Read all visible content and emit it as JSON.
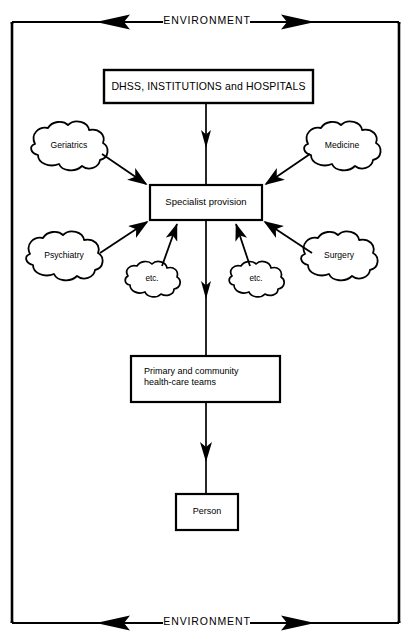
{
  "figure": {
    "type": "flow-diagram",
    "title_visible": false,
    "background_color": "#ffffff",
    "line_color": "#000000"
  },
  "environment": {
    "top_label": "ENVIRONMENT",
    "bottom_label": "ENVIRONMENT",
    "top_arrow_left": "left-arrow-icon",
    "top_arrow_right": "right-arrow-icon",
    "bottom_arrow_left": "left-arrow-icon",
    "bottom_arrow_right": "right-arrow-icon"
  },
  "nodes": {
    "dhss": {
      "label": "DHSS, INSTITUTIONS and HOSPITALS",
      "shape": "rectangle"
    },
    "specialist": {
      "label": "Specialist provision",
      "shape": "rectangle"
    },
    "primary": {
      "line1": "Primary and community",
      "line2": "health-care teams",
      "shape": "rectangle"
    },
    "person": {
      "label": "Person",
      "shape": "rectangle"
    }
  },
  "clouds": [
    {
      "id": "geriatrics",
      "label": "Geriatrics",
      "position": "top-left"
    },
    {
      "id": "medicine",
      "label": "Medicine",
      "position": "top-right"
    },
    {
      "id": "psychiatry",
      "label": "Psychiatry",
      "position": "mid-left"
    },
    {
      "id": "surgery",
      "label": "Surgery",
      "position": "mid-right"
    },
    {
      "id": "etc-left",
      "label": "etc.",
      "position": "bottom-left-inner"
    },
    {
      "id": "etc-right",
      "label": "etc.",
      "position": "bottom-right-inner"
    }
  ],
  "connections": [
    {
      "from": "dhss",
      "to": "specialist",
      "style": "down-arrow"
    },
    {
      "from": "geriatrics",
      "to": "specialist",
      "style": "arrow"
    },
    {
      "from": "medicine",
      "to": "specialist",
      "style": "arrow"
    },
    {
      "from": "psychiatry",
      "to": "specialist",
      "style": "arrow"
    },
    {
      "from": "surgery",
      "to": "specialist",
      "style": "arrow"
    },
    {
      "from": "etc-left",
      "to": "specialist",
      "style": "arrow"
    },
    {
      "from": "etc-right",
      "to": "specialist",
      "style": "arrow"
    },
    {
      "from": "specialist",
      "to": "primary",
      "style": "down-arrow"
    },
    {
      "from": "primary",
      "to": "person",
      "style": "down-arrow"
    }
  ]
}
